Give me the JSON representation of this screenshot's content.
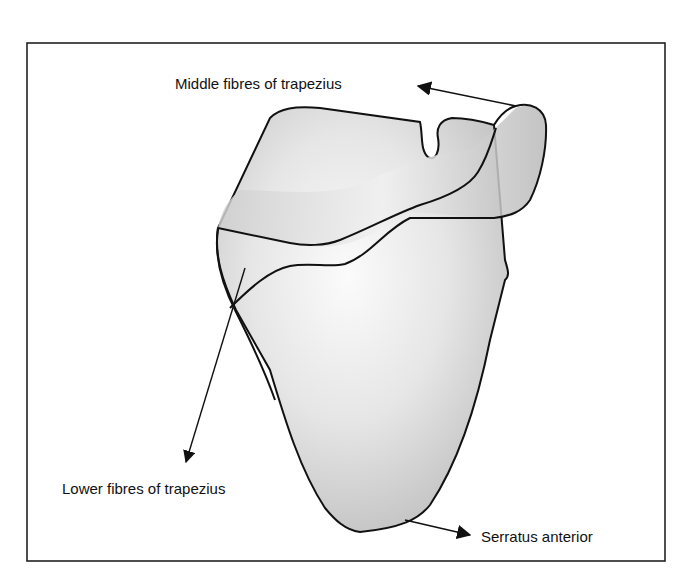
{
  "figure": {
    "type": "anatomical-diagram",
    "labels": {
      "middle_trapezius": "Middle fibres of trapezius",
      "lower_trapezius": "Lower fibres of trapezius",
      "serratus": "Serratus anterior"
    },
    "colors": {
      "outline": "#111111",
      "bone_light": "#f4f4f4",
      "bone_dark": "#b8b8b8",
      "border": "#222222"
    }
  }
}
